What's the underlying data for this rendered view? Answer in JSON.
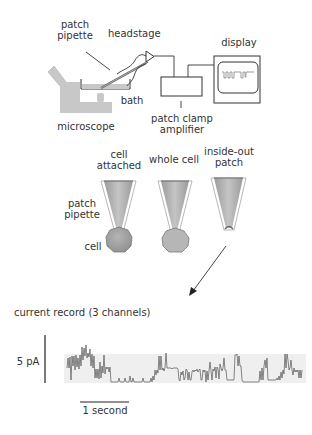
{
  "setup": {
    "labels": {
      "patch_pipette_line1": "patch",
      "patch_pipette_line2": "pipette",
      "headstage": "headstage",
      "display": "display",
      "bath": "bath",
      "microscope": "microscope",
      "amplifier_line1": "patch clamp",
      "amplifier_line2": "amplifier"
    }
  },
  "configurations": {
    "items": [
      {
        "line1": "cell",
        "line2": "attached"
      },
      {
        "line1": "whole cell",
        "line2": ""
      },
      {
        "line1": "inside-out",
        "line2": "patch"
      }
    ],
    "side_label_line1": "patch",
    "side_label_line2": "pipette",
    "cell_label": "cell"
  },
  "recording": {
    "title": "current record (3 channels)",
    "amplitude_scale": "5 pA",
    "time_scale": "1 second"
  },
  "colors": {
    "line": "#2a2a2a",
    "gray_fill": "#c8c8c8",
    "pipette_fill": "#a8a8a8",
    "cell_fill": "#9a9a9a",
    "trace_bg": "#efefef"
  }
}
